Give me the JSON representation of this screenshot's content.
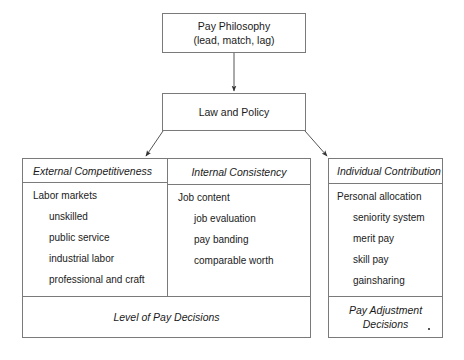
{
  "diagram": {
    "title_node": {
      "line1": "Pay Philosophy",
      "line2": "(lead, match, lag)"
    },
    "policy_node": {
      "label": "Law and Policy"
    },
    "pillars": [
      {
        "id": "external",
        "header": "External Competitiveness",
        "lead": "Labor markets",
        "sub": [
          "unskilled",
          "public service",
          "industrial labor",
          "professional and craft"
        ]
      },
      {
        "id": "internal",
        "header": "Internal Consistency",
        "lead": "Job content",
        "sub": [
          "job evaluation",
          "pay banding",
          "comparable worth"
        ]
      },
      {
        "id": "individual",
        "header": "Individual Contribution",
        "lead": "Personal allocation",
        "sub": [
          "seniority system",
          "merit pay",
          "skill pay",
          "gainsharing"
        ]
      }
    ],
    "footers": {
      "level_of_pay": "Level of Pay Decisions",
      "pay_adjustment_line1": "Pay Adjustment",
      "pay_adjustment_line2": "Decisions"
    },
    "colors": {
      "stroke": "#7a7a7a",
      "arrow": "#333333",
      "background": "#ffffff",
      "text": "#1a1a1a"
    }
  }
}
